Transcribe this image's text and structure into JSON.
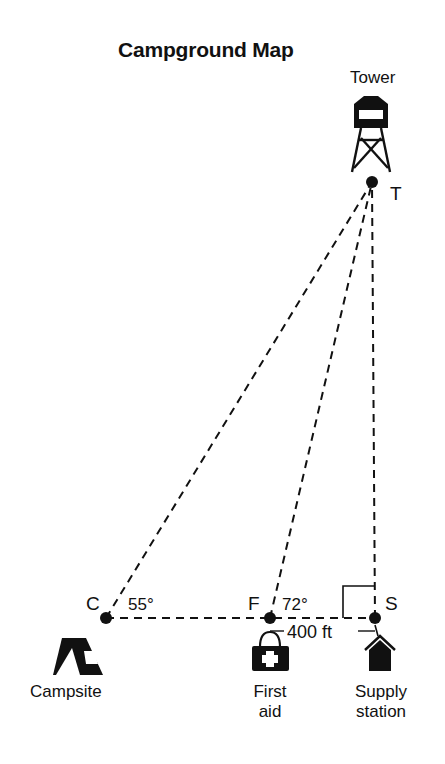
{
  "title": "Campground Map",
  "points": {
    "T": {
      "letter": "T",
      "name": "Tower"
    },
    "C": {
      "letter": "C",
      "name": "Campsite"
    },
    "F": {
      "letter": "F",
      "name_line1": "First",
      "name_line2": "aid"
    },
    "S": {
      "letter": "S",
      "name_line1": "Supply",
      "name_line2": "station"
    }
  },
  "angles": {
    "C": "55°",
    "F": "72°"
  },
  "measurements": {
    "FS": "400 ft"
  },
  "colors": {
    "ink": "#111111",
    "background": "#ffffff"
  }
}
